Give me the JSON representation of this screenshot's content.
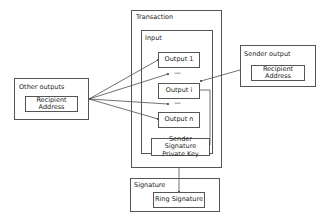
{
  "diagram": {
    "transaction": {
      "title": "Transaction"
    },
    "input": {
      "title": "Input",
      "outputs": [
        "Output 1",
        "Output i",
        "Output n"
      ],
      "ellipsis": [
        "...",
        "..."
      ],
      "sender_key": "Sender Signature Private Key"
    },
    "other_outputs": {
      "title": "Other outputs",
      "field": "Recipient Address"
    },
    "sender_output": {
      "title": "Sender output",
      "field": "Recipient Address"
    },
    "signature": {
      "title": "Signature",
      "field": "Ring Signature"
    },
    "edges": [
      {
        "from": "other_outputs",
        "to": "Output 1"
      },
      {
        "from": "other_outputs",
        "to": "ellipsis-1"
      },
      {
        "from": "other_outputs",
        "to": "ellipsis-2"
      },
      {
        "from": "other_outputs",
        "to": "Output n"
      },
      {
        "from": "sender_output",
        "to": "Output i"
      },
      {
        "from": "Output i",
        "to": "Sender Signature Private Key"
      },
      {
        "from": "transaction",
        "to": "Ring Signature"
      }
    ]
  }
}
